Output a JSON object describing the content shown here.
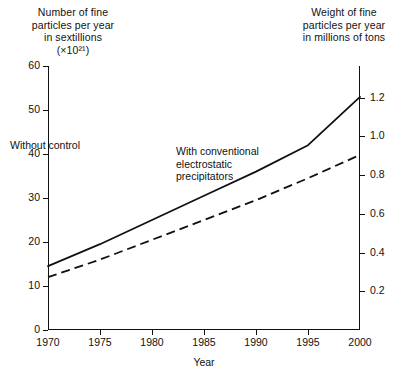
{
  "titles": {
    "left": "Number of fine\nparticles per year\nin sextillions\n(×10²¹)",
    "right": "Weight of fine\nparticles per year\nin millions of tons"
  },
  "annotations": {
    "without": "Without control",
    "with": "With conventional\nelectrostatic\nprecipitators"
  },
  "chart_data": {
    "type": "line",
    "title": "",
    "xlabel": "Year",
    "ylabel": "Number of fine particles per year in sextillions (×10²¹)",
    "y2label": "Weight of fine particles per year in millions of tons",
    "x": [
      1970,
      1975,
      1980,
      1985,
      1990,
      1995,
      2000
    ],
    "xlim": [
      1970,
      2000
    ],
    "ylim": [
      0,
      60
    ],
    "y2lim": [
      0,
      1.3636
    ],
    "yticks": [
      0,
      10,
      20,
      30,
      40,
      50,
      60
    ],
    "yticklabels": [
      "0",
      "10",
      "20",
      "30",
      "40",
      "50",
      "60"
    ],
    "y2ticks": [
      0.2,
      0.4,
      0.6,
      0.8,
      1.0,
      1.2
    ],
    "y2ticklabels": [
      "0.2",
      "0.4",
      "0.6",
      "0.8",
      "1.0",
      "1.2"
    ],
    "xticks": [
      1970,
      1975,
      1980,
      1985,
      1990,
      1995,
      2000
    ],
    "xticklabels": [
      "1970",
      "1975",
      "1980",
      "1985",
      "1990",
      "1995",
      "2000"
    ],
    "grid": false,
    "legend_position": "inline-annotation",
    "series": [
      {
        "name": "Without control",
        "style": "solid",
        "color": "#111111",
        "values": [
          14.5,
          19.5,
          25.0,
          30.5,
          36.0,
          42.0,
          53.0
        ]
      },
      {
        "name": "With conventional electrostatic precipitators",
        "style": "dashed",
        "color": "#111111",
        "values": [
          12.0,
          16.0,
          20.5,
          25.0,
          29.5,
          34.5,
          39.8
        ]
      }
    ]
  }
}
